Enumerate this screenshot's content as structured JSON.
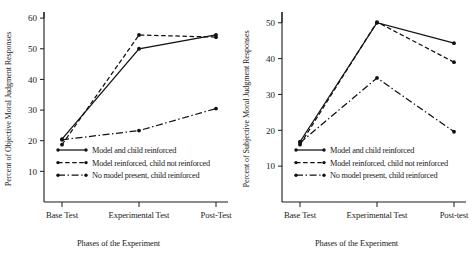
{
  "figure": {
    "caption_partial": "",
    "panels": [
      {
        "id": "left",
        "ylabel": "Percent of Objective Moral Judgment Responses",
        "xlabel": "Phases of the Experiment",
        "categories": [
          "Base Test",
          "Experimental Test",
          "Post-Test"
        ],
        "yticks": [
          10,
          20,
          30,
          40,
          50,
          60
        ],
        "legend": [
          "Model and child reinforced",
          "Model reinforced, child not reinforced",
          "No model present, child reinforced"
        ]
      },
      {
        "id": "right",
        "ylabel": "Percent of Subjective Moral Judgment Responses",
        "xlabel": "Phases of the Experiment",
        "categories": [
          "Base Test",
          "Experimental Test",
          "Post-test"
        ],
        "yticks": [
          10,
          20,
          30,
          40,
          50
        ],
        "legend": [
          "Model and child reinforced",
          "Model reinforced, child not reinforced",
          "No model present, child reinforced"
        ]
      }
    ]
  },
  "chart_data": [
    {
      "type": "line",
      "panel": "left",
      "title": "",
      "xlabel": "Phases of the Experiment",
      "ylabel": "Percent of Objective Moral Judgment Responses",
      "categories": [
        "Base Test",
        "Experimental Test",
        "Post-Test"
      ],
      "ylim": [
        0,
        62
      ],
      "yticks": [
        10,
        20,
        30,
        40,
        50,
        60
      ],
      "grid": false,
      "legend_position": "lower-left-inside",
      "series": [
        {
          "name": "Model and child reinforced",
          "style": "solid",
          "values": [
            20.5,
            50.0,
            54.5
          ]
        },
        {
          "name": "Model reinforced, child not reinforced",
          "style": "dashed",
          "values": [
            18.7,
            54.5,
            53.8
          ]
        },
        {
          "name": "No model present, child reinforced",
          "style": "dash-dot",
          "values": [
            20.3,
            23.3,
            30.5
          ]
        }
      ]
    },
    {
      "type": "line",
      "panel": "right",
      "title": "",
      "xlabel": "Phases of the Experiment",
      "ylabel": "Percent of Subjective Moral Judgment Responses",
      "categories": [
        "Base Test",
        "Experimental Test",
        "Post-test"
      ],
      "ylim": [
        0,
        53
      ],
      "yticks": [
        10,
        20,
        30,
        40,
        50
      ],
      "grid": false,
      "legend_position": "lower-left-inside",
      "series": [
        {
          "name": "Model and child reinforced",
          "style": "solid",
          "values": [
            16.8,
            50.0,
            44.3
          ]
        },
        {
          "name": "Model reinforced, child not reinforced",
          "style": "dashed",
          "values": [
            16.0,
            50.2,
            39.0
          ]
        },
        {
          "name": "No model present, child reinforced",
          "style": "dash-dot",
          "values": [
            16.5,
            34.6,
            19.6
          ]
        }
      ]
    }
  ]
}
